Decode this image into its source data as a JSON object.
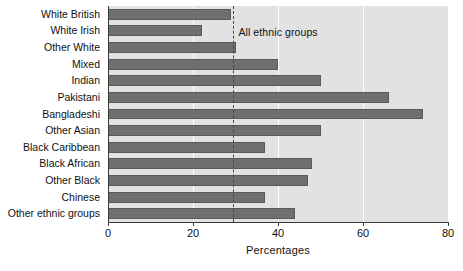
{
  "chart_data": {
    "type": "bar",
    "orientation": "horizontal",
    "title": "",
    "xlabel": "Percentages",
    "ylabel": "",
    "xlim": [
      0,
      80
    ],
    "xticks": [
      0,
      20,
      40,
      60,
      80
    ],
    "xtick_labels": [
      "0",
      "20",
      "40",
      "60",
      "80"
    ],
    "grid": "vertical-white-gridlines",
    "legend": "none",
    "categories": [
      "White British",
      "White Irish",
      "Other White",
      "Mixed",
      "Indian",
      "Pakistani",
      "Bangladeshi",
      "Other Asian",
      "Black Caribbean",
      "Black African",
      "Other Black",
      "Chinese",
      "Other ethnic groups"
    ],
    "values": [
      29,
      22,
      30,
      40,
      50,
      66,
      74,
      50,
      37,
      48,
      47,
      37,
      44
    ],
    "annotations": [
      {
        "type": "reference-line",
        "label": "All ethnic groups",
        "value": 29.5,
        "style": "dashed-vertical"
      }
    ],
    "colors": {
      "bar_fill": "#6f6f6f",
      "bar_edge": "#5a5a5a",
      "plot_background": "#e2e2e2",
      "gridline": "#ffffff",
      "axis": "#3a3a3a",
      "reference_line": "#4a4a4a",
      "text": "#111111",
      "figure_background": "#ffffff"
    }
  },
  "axis": {
    "x_title": "Percentages"
  },
  "reference": {
    "label": "All ethnic groups"
  }
}
